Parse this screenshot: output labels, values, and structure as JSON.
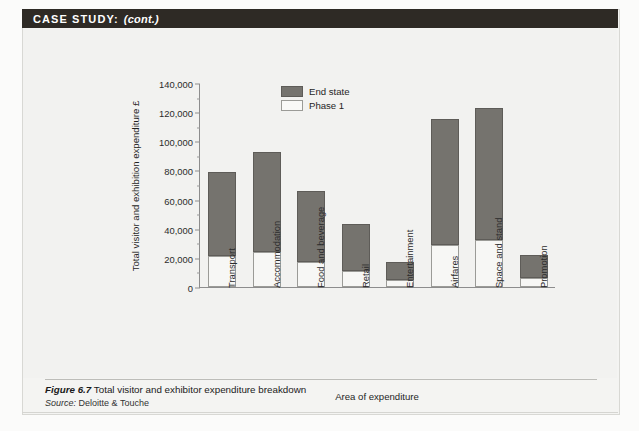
{
  "header": {
    "label": "CASE STUDY:",
    "continued": "(cont.)"
  },
  "figure": {
    "number": "Figure 6.7",
    "title": "Total visitor and exhibitor expenditure breakdown",
    "source_label": "Source:",
    "source_name": "Deloitte & Touche"
  },
  "legend": {
    "position": "inside-top-center",
    "items": [
      {
        "label": "End state",
        "color": "#75736e",
        "swatch": "end"
      },
      {
        "label": "Phase 1",
        "color": "#f9f9f7",
        "swatch": "phase"
      }
    ]
  },
  "chart_data": {
    "type": "bar",
    "stacked": true,
    "title": "Total visitor and exhibitor expenditure breakdown",
    "xlabel": "Area of expenditure",
    "ylabel": "Total visitor and exhibition expenditure £",
    "ylim": [
      0,
      140000
    ],
    "ytick_step": 20000,
    "yminor_step": 10000,
    "grid": false,
    "ytick_labels": [
      "0",
      "20,000",
      "40,000",
      "60,000",
      "80,000",
      "100,000",
      "120,000",
      "140,000"
    ],
    "ytick_values": [
      0,
      20000,
      40000,
      60000,
      80000,
      100000,
      120000,
      140000
    ],
    "categories": [
      "Transport",
      "Accommodation",
      "Food and beverage",
      "Retail",
      "Entertainment",
      "Airfares",
      "Space and stand",
      "Promotion"
    ],
    "series": [
      {
        "name": "Phase 1",
        "color": "#f9f9f7",
        "values": [
          21000,
          24000,
          17000,
          11000,
          5000,
          29000,
          32000,
          6000
        ]
      },
      {
        "name": "End state",
        "color": "#75736e",
        "values": [
          58000,
          69000,
          49000,
          32000,
          12500,
          86000,
          91000,
          16000
        ]
      }
    ],
    "totals": [
      79000,
      93000,
      66000,
      43000,
      17500,
      115000,
      123000,
      22000
    ]
  }
}
